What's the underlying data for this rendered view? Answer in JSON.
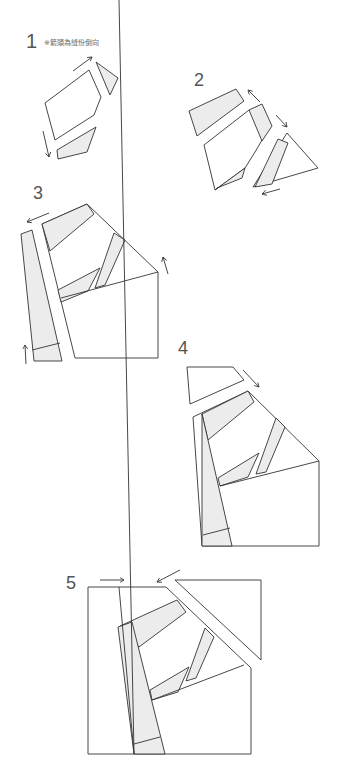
{
  "steps": [
    {
      "number": "1",
      "note": "※箭頭為縫份倒向"
    },
    {
      "number": "2"
    },
    {
      "number": "3"
    },
    {
      "number": "4"
    },
    {
      "number": "5"
    }
  ],
  "colors": {
    "stroke": "#333333",
    "fill_shaded": "#ececec",
    "fill_plain": "#ffffff",
    "text": "#555555"
  }
}
